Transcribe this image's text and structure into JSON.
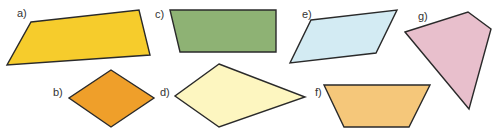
{
  "figure": {
    "shapes": [
      {
        "id": "a",
        "label": "a)",
        "kind": "trapezium",
        "fill": "#f6cc2c",
        "points": "31,22 139,10 150,55 7,65",
        "label_pos": [
          17,
          17
        ]
      },
      {
        "id": "b",
        "label": "b)",
        "kind": "rhombus",
        "fill": "#ef9f2a",
        "points": "111,70 154,98 111,127 69,98",
        "label_pos": [
          53,
          96
        ]
      },
      {
        "id": "c",
        "label": "c)",
        "kind": "trapezium",
        "fill": "#8eb274",
        "points": "170,10 276,10 276,52 180,52",
        "label_pos": [
          155,
          18
        ]
      },
      {
        "id": "d",
        "label": "d)",
        "kind": "kite",
        "fill": "#fdf6c0",
        "points": "219,64 305,97 219,127 175,96",
        "label_pos": [
          160,
          96
        ]
      },
      {
        "id": "e",
        "label": "e)",
        "kind": "parallelogram",
        "fill": "#d3ebf3",
        "points": "311,20 397,10 376,53 290,63",
        "label_pos": [
          302,
          18
        ]
      },
      {
        "id": "f",
        "label": "f)",
        "kind": "isosceles-trapezium",
        "fill": "#f5c77a",
        "points": "324,85 430,85 409,127 344,127",
        "label_pos": [
          315,
          96
        ]
      },
      {
        "id": "g",
        "label": "g)",
        "kind": "irregular-quadrilateral",
        "fill": "#e8bfcc",
        "points": "405,32 468,12 491,29 469,109",
        "label_pos": [
          418,
          20
        ]
      }
    ]
  }
}
